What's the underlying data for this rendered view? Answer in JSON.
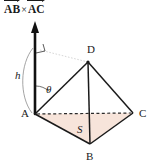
{
  "diagram": {
    "type": "geometry-tetrahedron",
    "title_caption": {
      "vector_1": "AB",
      "operator": "×",
      "vector_2": "AC"
    },
    "vertices": [
      {
        "id": "A",
        "label": "A",
        "x": 35,
        "y": 114
      },
      {
        "id": "B",
        "label": "B",
        "x": 90,
        "y": 144
      },
      {
        "id": "C",
        "label": "C",
        "x": 133,
        "y": 113
      },
      {
        "id": "D",
        "label": "D",
        "x": 88,
        "y": 62
      }
    ],
    "measures": [
      {
        "id": "height",
        "label": "h",
        "style": "italic"
      },
      {
        "id": "angle",
        "label": "θ",
        "style": "italic"
      },
      {
        "id": "area",
        "label": "S",
        "style": "italic"
      }
    ],
    "annotations": {
      "right_angle": "right-angle-mark",
      "height_arc": "height-brace-arc",
      "angle_arc": "theta-angle-arc",
      "normal_vector": "cross-product-arrow"
    },
    "edges": [
      {
        "from": "A",
        "to": "B",
        "style": "solid"
      },
      {
        "from": "B",
        "to": "C",
        "style": "solid"
      },
      {
        "from": "A",
        "to": "C",
        "style": "dashed"
      },
      {
        "from": "A",
        "to": "D",
        "style": "solid"
      },
      {
        "from": "B",
        "to": "D",
        "style": "solid"
      },
      {
        "from": "C",
        "to": "D",
        "style": "solid"
      }
    ],
    "colors": {
      "stroke": "#1a1a1a",
      "base_fill": "#f7e4da",
      "background": "#ffffff",
      "guide": "#b9b9b9"
    }
  }
}
